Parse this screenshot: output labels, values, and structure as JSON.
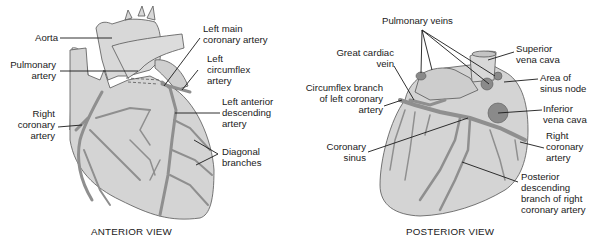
{
  "figure": {
    "panels": [
      {
        "id": "anterior",
        "caption": "ANTERIOR VIEW",
        "labels": {
          "aorta": "Aorta",
          "pulmonary_artery_1": "Pulmonary",
          "pulmonary_artery_2": "artery",
          "right_coronary_1": "Right",
          "right_coronary_2": "coronary",
          "right_coronary_3": "artery",
          "left_main_1": "Left main",
          "left_main_2": "coronary artery",
          "left_circ_1": "Left",
          "left_circ_2": "circumflex",
          "left_circ_3": "artery",
          "lad_1": "Left anterior",
          "lad_2": "descending",
          "lad_3": "artery",
          "diag_1": "Diagonal",
          "diag_2": "branches"
        }
      },
      {
        "id": "posterior",
        "caption": "POSTERIOR VIEW",
        "labels": {
          "pulm_veins": "Pulmonary veins",
          "great_cardiac_1": "Great cardiac",
          "great_cardiac_2": "vein",
          "circ_branch_1": "Circumflex branch",
          "circ_branch_2": "of left coronary",
          "circ_branch_3": "artery",
          "coronary_sinus_1": "Coronary",
          "coronary_sinus_2": "sinus",
          "svc_1": "Superior",
          "svc_2": "vena cava",
          "sinus_node_1": "Area of",
          "sinus_node_2": "sinus node",
          "ivc_1": "Inferior",
          "ivc_2": "vena cava",
          "rca_1": "Right",
          "rca_2": "coronary",
          "rca_3": "artery",
          "pda_1": "Posterior",
          "pda_2": "descending",
          "pda_3": "branch of right",
          "pda_4": "coronary artery"
        }
      }
    ],
    "colors": {
      "heart_fill": "#d4d4d4",
      "vessel_fill": "#8f8f8f",
      "outline": "#555555",
      "leader_line": "#1a1a1a",
      "vein_dark": "#7a7a7a"
    }
  }
}
